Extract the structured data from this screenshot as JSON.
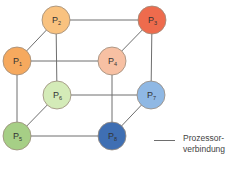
{
  "diagram": {
    "type": "hypercube-3d",
    "nodes": [
      {
        "id": "P1",
        "base": "P",
        "sub": "1",
        "x": 17,
        "y": 61,
        "r": 14,
        "fill": "#f6a95e"
      },
      {
        "id": "P2",
        "base": "P",
        "sub": "2",
        "x": 56,
        "y": 20,
        "r": 14,
        "fill": "#f9c27f"
      },
      {
        "id": "P3",
        "base": "P",
        "sub": "3",
        "x": 152,
        "y": 20,
        "r": 14,
        "fill": "#ee6b4d"
      },
      {
        "id": "P4",
        "base": "P",
        "sub": "4",
        "x": 112,
        "y": 61,
        "r": 14,
        "fill": "#f7c0a3"
      },
      {
        "id": "P5",
        "base": "P",
        "sub": "5",
        "x": 17,
        "y": 136,
        "r": 14,
        "fill": "#a6cf86"
      },
      {
        "id": "P6",
        "base": "P",
        "sub": "6",
        "x": 57,
        "y": 95,
        "r": 14,
        "fill": "#d4ebb8"
      },
      {
        "id": "P7",
        "base": "P",
        "sub": "7",
        "x": 151,
        "y": 95,
        "r": 14,
        "fill": "#8fb8e4"
      },
      {
        "id": "P8",
        "base": "P",
        "sub": "8",
        "x": 112,
        "y": 136,
        "r": 14,
        "fill": "#3f6fb3"
      }
    ],
    "edges": [
      [
        "P1",
        "P2"
      ],
      [
        "P2",
        "P3"
      ],
      [
        "P3",
        "P4"
      ],
      [
        "P1",
        "P4"
      ],
      [
        "P5",
        "P6"
      ],
      [
        "P6",
        "P7"
      ],
      [
        "P7",
        "P8"
      ],
      [
        "P5",
        "P8"
      ],
      [
        "P1",
        "P5"
      ],
      [
        "P2",
        "P6"
      ],
      [
        "P3",
        "P7"
      ],
      [
        "P4",
        "P8"
      ]
    ],
    "edge_color": "#6e6e6e"
  },
  "legend": {
    "line_label": "Prozessor-\nverbindung"
  }
}
